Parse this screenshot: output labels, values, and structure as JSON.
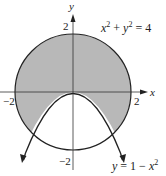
{
  "diagram": {
    "type": "region-between-curves",
    "axes": {
      "x_label": "x",
      "y_label": "y",
      "ticks": {
        "x_neg": "−2",
        "x_pos": "2",
        "y_pos": "2",
        "y_neg": "−2"
      }
    },
    "curves": [
      {
        "name": "circle",
        "equation_label": {
          "base1": "x",
          "exp1": "2",
          "plus": " + ",
          "base2": "y",
          "exp2": "2",
          "rhs": " = 4"
        }
      },
      {
        "name": "parabola",
        "equation_label": {
          "lhs": "y",
          "eq": " = 1 − ",
          "base": "x",
          "exp": "2"
        }
      }
    ],
    "shaded_region": "inside circle x²+y²=4 and outside (above) parabola y=1−x²",
    "colors": {
      "shade": "#b8b8b8",
      "stroke": "#222222",
      "background": "#ffffff"
    }
  }
}
